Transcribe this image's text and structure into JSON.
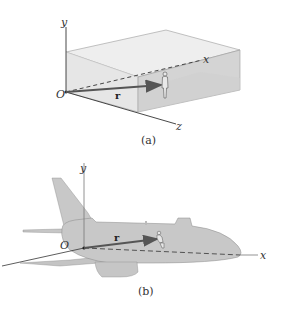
{
  "figure_a": {
    "caption": "(a)",
    "axes": {
      "x": "x",
      "y": "y",
      "z": "z",
      "origin": "O"
    },
    "vector_label": "r",
    "scene": "box-room-with-person",
    "colors": {
      "box_top": "#ececec",
      "box_left": "#e4e4e4",
      "box_front": "#d2d2d2",
      "box_inner": "#dadada",
      "vector": "#555555"
    }
  },
  "figure_b": {
    "caption": "(b)",
    "axes": {
      "x": "x",
      "y": "y",
      "origin": "O"
    },
    "vector_label": "r",
    "scene": "airplane-with-passenger",
    "colors": {
      "fuselage": "#c8c8c8",
      "vector": "#555555"
    }
  }
}
